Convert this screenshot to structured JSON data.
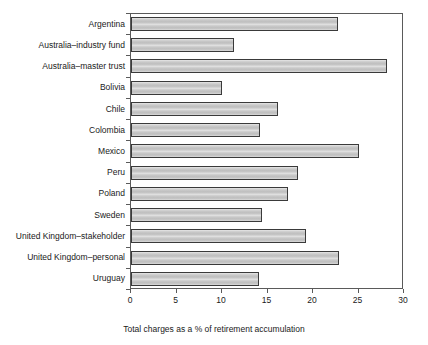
{
  "chart_data": {
    "type": "bar",
    "orientation": "horizontal",
    "title": "",
    "xlabel": "Total charges as a % of retirement accumulation",
    "ylabel": "",
    "xlim": [
      0,
      30
    ],
    "xticks": [
      0,
      5,
      10,
      15,
      20,
      25,
      30
    ],
    "xtick_labels": [
      "0",
      "5",
      "10",
      "15",
      "20",
      "25",
      "30"
    ],
    "grid": false,
    "legend": false,
    "categories": [
      "Argentina",
      "Australia–industry fund",
      "Australia–master trust",
      "Bolivia",
      "Chile",
      "Colombia",
      "Mexico",
      "Peru",
      "Poland",
      "Sweden",
      "United Kingdom–stakeholder",
      "United Kingdom–personal",
      "Uruguay"
    ],
    "values": [
      22.8,
      11.3,
      28.1,
      10.0,
      16.1,
      14.2,
      25.0,
      18.4,
      17.2,
      14.4,
      19.2,
      22.9,
      14.1
    ],
    "series": [
      {
        "name": "Total charges as a % of retirement accumulation",
        "values": [
          22.8,
          11.3,
          28.1,
          10.0,
          16.1,
          14.2,
          25.0,
          18.4,
          17.2,
          14.4,
          19.2,
          22.9,
          14.1
        ]
      }
    ],
    "bar_fill_color": "#c9c9c9",
    "bar_edge_color": "#3a3a3a",
    "axis_color": "#5a5a5a",
    "background_color": "#ffffff"
  }
}
